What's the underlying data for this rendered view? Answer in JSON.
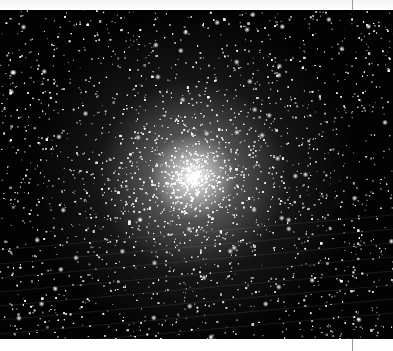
{
  "image": {
    "subject": "globular star cluster",
    "alt": "Dense globular star cluster with a bright white core against a black starfield",
    "colors": {
      "background": "#030303",
      "core": "#ffffff",
      "page": "#ffffff",
      "page_edge": "#9a9a9a"
    },
    "core_center": [
      193,
      177
    ]
  },
  "caption": {
    "text": ""
  }
}
